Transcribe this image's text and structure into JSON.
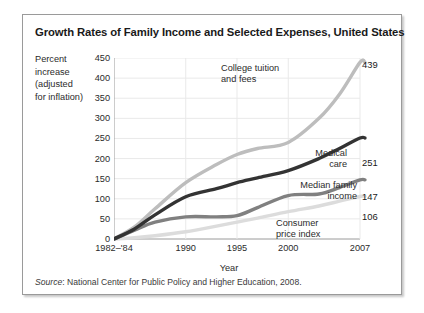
{
  "figure": {
    "title": "Growth Rates of Family Income and Selected Expenses, United States",
    "source_prefix": "Source",
    "source_text": ": National Center for Public Policy and Higher Education, 2008."
  },
  "axes": {
    "ylabel_lines": [
      "Percent",
      "increase",
      "(adjusted",
      "for inflation)"
    ],
    "xlabel": "Year",
    "yticks": [
      "450",
      "400",
      "350",
      "300",
      "250",
      "200",
      "150",
      "100",
      "50",
      "0"
    ],
    "xticks": [
      "1982–'84",
      "1990",
      "1995",
      "2000",
      "2007"
    ]
  },
  "annotations": {
    "tuition_line1": "College tuition",
    "tuition_line2": "and fees",
    "medical_line1": "Medical",
    "medical_line2": "care",
    "income_line1": "Median family",
    "income_line2": "income",
    "cpi_line1": "Consumer",
    "cpi_line2": "price index",
    "tuition_value": "439",
    "medical_value": "251",
    "income_value": "147",
    "cpi_value": "106"
  },
  "colors": {
    "tuition": "#bdbdbd",
    "medical": "#333333",
    "income": "#808080",
    "cpi": "#dcdcdc",
    "grid": "#e9e9e9",
    "axis": "#9a9a9a",
    "frame": "#9a9a9a",
    "text": "#2b2b2b"
  },
  "chart_data": {
    "type": "line",
    "title": "Growth Rates of Family Income and Selected Expenses, United States",
    "xlabel": "Year",
    "ylabel": "Percent increase (adjusted for inflation)",
    "xlim": [
      1983,
      2007
    ],
    "ylim": [
      0,
      450
    ],
    "ytick_values": [
      0,
      50,
      100,
      150,
      200,
      250,
      300,
      350,
      400,
      450
    ],
    "xtick_values": [
      1983,
      1990,
      1995,
      2000,
      2007
    ],
    "xtick_labels": [
      "1982–'84",
      "1990",
      "1995",
      "2000",
      "2007"
    ],
    "grid": true,
    "legend": "inline-annotations",
    "x": [
      1983,
      1985,
      1987,
      1990,
      1993,
      1995,
      1997,
      2000,
      2003,
      2005,
      2007
    ],
    "series": [
      {
        "name": "College tuition and fees",
        "color": "#bdbdbd",
        "end_label": "439",
        "values": [
          0,
          30,
          75,
          140,
          185,
          210,
          225,
          240,
          300,
          360,
          439
        ]
      },
      {
        "name": "Medical care",
        "color": "#333333",
        "end_label": "251",
        "values": [
          0,
          25,
          60,
          105,
          125,
          140,
          152,
          170,
          200,
          225,
          251
        ]
      },
      {
        "name": "Median family income",
        "color": "#808080",
        "end_label": "147",
        "values": [
          0,
          22,
          42,
          55,
          55,
          58,
          78,
          108,
          112,
          128,
          147
        ]
      },
      {
        "name": "Consumer price index",
        "color": "#dcdcdc",
        "end_label": "106",
        "values": [
          0,
          3,
          8,
          18,
          32,
          42,
          52,
          68,
          82,
          94,
          106
        ]
      }
    ]
  }
}
